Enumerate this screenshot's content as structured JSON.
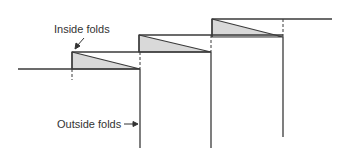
{
  "diagram": {
    "labels": {
      "inside": "Inside folds",
      "outside": "Outside folds"
    },
    "colors": {
      "line": "#3a3a3a",
      "fill": "#d9d9d9",
      "text": "#333333"
    }
  }
}
